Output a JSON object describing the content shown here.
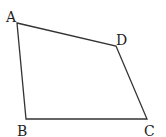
{
  "diagram": {
    "type": "quadrilateral",
    "vertices": [
      {
        "id": "A",
        "label": "A",
        "x": 17,
        "y": 23,
        "lx": 6,
        "ly": 22
      },
      {
        "id": "D",
        "label": "D",
        "x": 116,
        "y": 46,
        "lx": 116,
        "ly": 45
      },
      {
        "id": "C",
        "label": "C",
        "x": 147,
        "y": 119,
        "lx": 144,
        "ly": 136
      },
      {
        "id": "B",
        "label": "B",
        "x": 26,
        "y": 119,
        "lx": 17,
        "ly": 136
      }
    ],
    "edges": [
      [
        "A",
        "D"
      ],
      [
        "D",
        "C"
      ],
      [
        "C",
        "B"
      ],
      [
        "B",
        "A"
      ]
    ],
    "stroke_color": "#333333"
  }
}
